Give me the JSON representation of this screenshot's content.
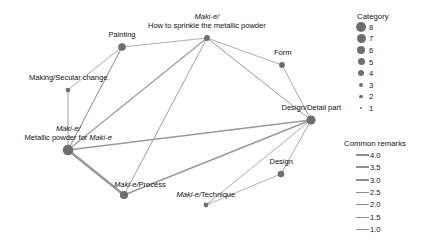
{
  "chart_data": {
    "type": "scatter",
    "subtype": "network-graph",
    "title": "",
    "xlabel": "",
    "ylabel": "",
    "grid": false,
    "background": "#ffffff",
    "node_color": "#6e6e6e",
    "edge_color": "#9a9a9a",
    "nodes": [
      {
        "id": "how-to-sprinkle",
        "label_lines": [
          {
            "text": "Maki-e/",
            "italic": true
          },
          {
            "text": "How to sprinkle the metallic powder",
            "italic": false
          }
        ],
        "label_plain": "Maki-e/ How to sprinkle the metallic powder",
        "x": 207,
        "y": 38,
        "category": 3,
        "radius": 2.9,
        "label_x": 207,
        "label_y": 12,
        "label_align": "center"
      },
      {
        "id": "painting",
        "label_lines": [
          {
            "text": "Painting",
            "italic": false
          }
        ],
        "label_plain": "Painting",
        "x": 122,
        "y": 47,
        "category": 5,
        "radius": 3.8,
        "label_x": 122,
        "label_y": 30,
        "label_align": "center"
      },
      {
        "id": "form",
        "label_lines": [
          {
            "text": "Form",
            "italic": false
          }
        ],
        "label_plain": "Form",
        "x": 282,
        "y": 65,
        "category": 3,
        "radius": 2.9,
        "label_x": 283,
        "label_y": 48,
        "label_align": "center"
      },
      {
        "id": "making-secular-change",
        "label_lines": [
          {
            "text": "Making/Secular change",
            "italic": false
          }
        ],
        "label_plain": "Making/Secular change",
        "x": 68,
        "y": 90,
        "category": 2,
        "radius": 2.3,
        "label_x": 68,
        "label_y": 73,
        "label_align": "center"
      },
      {
        "id": "design-detail-part",
        "label_lines": [
          {
            "text": "Design/Detail part",
            "italic": false
          }
        ],
        "label_plain": "Design/Detail part",
        "x": 311,
        "y": 120,
        "category": 7,
        "radius": 4.6,
        "label_x": 311,
        "label_y": 103,
        "label_align": "center"
      },
      {
        "id": "metallic-powder",
        "label_lines": [
          {
            "text": "Maki-e/",
            "italic": true
          },
          {
            "text": "Metallic powder for Maki-e",
            "italic": false
          }
        ],
        "label_plain": "Maki-e/ Metallic powder for Maki-e",
        "x": 68,
        "y": 150,
        "category": 8,
        "radius": 5.3,
        "label_x": 68,
        "label_y": 124,
        "label_align": "center"
      },
      {
        "id": "design",
        "label_lines": [
          {
            "text": "Design",
            "italic": false
          }
        ],
        "label_plain": "Design",
        "x": 281,
        "y": 174,
        "category": 4,
        "radius": 3.3,
        "label_x": 281,
        "label_y": 157,
        "label_align": "center"
      },
      {
        "id": "maki-e-process",
        "label_lines": [
          {
            "text": "Maki-e/Process",
            "italic": true,
            "partial_italic": "Maki-e/"
          }
        ],
        "label_plain": "Maki-e/Process",
        "x": 124,
        "y": 195,
        "category": 6,
        "radius": 4.1,
        "label_x": 140,
        "label_y": 180,
        "label_align": "center"
      },
      {
        "id": "maki-e-technique",
        "label_lines": [
          {
            "text": "Maki-e/Technique",
            "italic": true,
            "partial_italic": "Maki-e/"
          }
        ],
        "label_plain": "Maki-e/Technique",
        "x": 206,
        "y": 205,
        "category": 2,
        "radius": 2.4,
        "label_x": 206,
        "label_y": 190,
        "label_align": "center"
      }
    ],
    "edges": [
      {
        "source": "painting",
        "target": "making-secular-change",
        "weight": 1.3,
        "width": 0.85
      },
      {
        "source": "painting",
        "target": "how-to-sprinkle",
        "weight": 1.2,
        "width": 0.8
      },
      {
        "source": "painting",
        "target": "metallic-powder",
        "weight": 1.6,
        "width": 1.05
      },
      {
        "source": "making-secular-change",
        "target": "metallic-powder",
        "weight": 1.4,
        "width": 0.9
      },
      {
        "source": "how-to-sprinkle",
        "target": "metallic-powder",
        "weight": 1.7,
        "width": 1.15
      },
      {
        "source": "how-to-sprinkle",
        "target": "maki-e-process",
        "weight": 1.4,
        "width": 0.95
      },
      {
        "source": "how-to-sprinkle",
        "target": "form",
        "weight": 1.2,
        "width": 0.8
      },
      {
        "source": "how-to-sprinkle",
        "target": "design-detail-part",
        "weight": 1.5,
        "width": 1.0
      },
      {
        "source": "form",
        "target": "design-detail-part",
        "weight": 1.3,
        "width": 0.85
      },
      {
        "source": "metallic-powder",
        "target": "design-detail-part",
        "weight": 2.2,
        "width": 1.45
      },
      {
        "source": "metallic-powder",
        "target": "maki-e-process",
        "weight": 4.0,
        "width": 2.6
      },
      {
        "source": "maki-e-process",
        "target": "design-detail-part",
        "weight": 2.4,
        "width": 1.55
      },
      {
        "source": "maki-e-technique",
        "target": "design-detail-part",
        "weight": 1.3,
        "width": 0.85
      },
      {
        "source": "design",
        "target": "design-detail-part",
        "weight": 1.4,
        "width": 0.9
      },
      {
        "source": "design",
        "target": "maki-e-technique",
        "weight": 1.1,
        "width": 0.75
      }
    ]
  },
  "legends": {
    "category": {
      "title": "Category",
      "items": [
        {
          "label": "8",
          "radius": 5.2
        },
        {
          "label": "7",
          "radius": 4.5
        },
        {
          "label": "6",
          "radius": 4.0
        },
        {
          "label": "5",
          "radius": 3.5
        },
        {
          "label": "4",
          "radius": 3.0
        },
        {
          "label": "3",
          "radius": 2.4
        },
        {
          "label": "2",
          "radius": 1.8
        },
        {
          "label": "1",
          "radius": 1.2
        }
      ]
    },
    "common_remarks": {
      "title": "Common remarks",
      "items": [
        {
          "label": "4.0",
          "width": 2.6
        },
        {
          "label": "3.5",
          "width": 2.2
        },
        {
          "label": "3.0",
          "width": 1.8
        },
        {
          "label": "2.5",
          "width": 1.4
        },
        {
          "label": "2.0",
          "width": 1.1
        },
        {
          "label": "1.5",
          "width": 0.8
        },
        {
          "label": "1.0",
          "width": 0.5
        }
      ]
    }
  }
}
